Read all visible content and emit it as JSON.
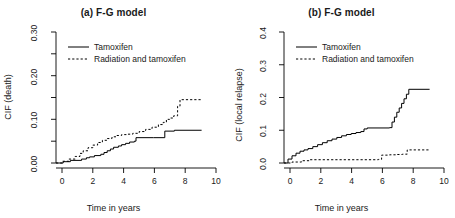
{
  "figure": {
    "panels": [
      {
        "id": "a",
        "title": "(a) F-G model",
        "xlabel": "Time in years",
        "ylabel": "CIF (death)"
      },
      {
        "id": "b",
        "title": "(b) F-G model",
        "xlabel": "Time in years",
        "ylabel": "CIF (local relapse)"
      }
    ],
    "legend": {
      "entries": [
        {
          "label": "Tamoxifen",
          "style": "solid"
        },
        {
          "label": "Radiation and tamoxifen",
          "style": "dashed"
        }
      ]
    },
    "colors": {
      "line": "#000000",
      "axis": "#000000",
      "background": "#ffffff"
    }
  },
  "chart_data": [
    {
      "type": "line",
      "title": "(a) F-G model",
      "xlabel": "Time in years",
      "ylabel": "CIF (death)",
      "xlim": [
        0,
        10
      ],
      "ylim": [
        0,
        0.3
      ],
      "xticks": [
        0,
        2,
        4,
        6,
        8,
        10
      ],
      "xtick_labels": [
        "0",
        "2",
        "4",
        "6",
        "8",
        "10"
      ],
      "yticks": [
        0.0,
        0.05,
        0.1,
        0.15,
        0.2,
        0.25,
        0.3
      ],
      "ytick_labels": [
        "0.00",
        "",
        "0.10",
        "",
        "0.20",
        "",
        "0.30"
      ],
      "grid": false,
      "legend_position": "top-left",
      "step": "post",
      "series": [
        {
          "name": "Tamoxifen",
          "style": "solid",
          "x": [
            0.0,
            0.45,
            0.9,
            1.6,
            1.9,
            2.1,
            2.4,
            2.8,
            3.0,
            3.2,
            3.4,
            3.6,
            3.9,
            4.1,
            4.35,
            4.6,
            4.9,
            5.0,
            6.1,
            6.8,
            7.4,
            9.1
          ],
          "y": [
            0.0,
            0.003,
            0.006,
            0.009,
            0.012,
            0.014,
            0.017,
            0.02,
            0.024,
            0.028,
            0.032,
            0.036,
            0.039,
            0.042,
            0.045,
            0.048,
            0.05,
            0.058,
            0.058,
            0.073,
            0.075,
            0.075
          ]
        },
        {
          "name": "Radiation and tamoxifen",
          "style": "dashed",
          "x": [
            0.0,
            0.4,
            0.8,
            1.2,
            1.5,
            1.7,
            2.0,
            2.3,
            2.6,
            2.9,
            3.2,
            3.5,
            3.8,
            4.1,
            4.4,
            4.8,
            5.2,
            5.6,
            6.0,
            6.4,
            6.7,
            6.9,
            7.1,
            7.35,
            7.6,
            7.75,
            9.1
          ],
          "y": [
            0.0,
            0.004,
            0.009,
            0.015,
            0.022,
            0.028,
            0.035,
            0.041,
            0.047,
            0.052,
            0.056,
            0.06,
            0.063,
            0.065,
            0.066,
            0.068,
            0.072,
            0.077,
            0.082,
            0.088,
            0.093,
            0.1,
            0.103,
            0.108,
            0.13,
            0.145,
            0.145
          ]
        }
      ]
    },
    {
      "type": "line",
      "title": "(b) F-G model",
      "xlabel": "Time in years",
      "ylabel": "CIF (local relapse)",
      "xlim": [
        0,
        10
      ],
      "ylim": [
        0,
        0.4
      ],
      "xticks": [
        0,
        2,
        4,
        6,
        8,
        10
      ],
      "xtick_labels": [
        "0",
        "2",
        "4",
        "6",
        "8",
        "10"
      ],
      "yticks": [
        0.0,
        0.1,
        0.2,
        0.3,
        0.4
      ],
      "ytick_labels": [
        "0.0",
        "0.1",
        "0.2",
        "0.3",
        "0.4"
      ],
      "grid": false,
      "legend_position": "top-left",
      "step": "post",
      "series": [
        {
          "name": "Tamoxifen",
          "style": "solid",
          "x": [
            0.0,
            0.25,
            0.5,
            0.75,
            1.0,
            1.25,
            1.5,
            1.8,
            2.1,
            2.4,
            2.7,
            3.0,
            3.3,
            3.6,
            3.9,
            4.2,
            4.5,
            4.8,
            5.0,
            5.2,
            6.0,
            6.6,
            6.75,
            6.9,
            7.05,
            7.2,
            7.35,
            7.5,
            7.65,
            7.8,
            9.1
          ],
          "y": [
            0.0,
            0.012,
            0.022,
            0.03,
            0.036,
            0.04,
            0.044,
            0.05,
            0.056,
            0.062,
            0.068,
            0.073,
            0.078,
            0.083,
            0.087,
            0.09,
            0.093,
            0.096,
            0.104,
            0.107,
            0.107,
            0.108,
            0.125,
            0.14,
            0.155,
            0.168,
            0.182,
            0.196,
            0.21,
            0.225,
            0.225
          ]
        },
        {
          "name": "Radiation and tamoxifen",
          "style": "dashed",
          "x": [
            0.0,
            0.5,
            1.1,
            1.6,
            3.0,
            5.0,
            5.9,
            6.1,
            6.6,
            7.0,
            7.4,
            7.7,
            9.1
          ],
          "y": [
            0.0,
            0.003,
            0.007,
            0.01,
            0.01,
            0.01,
            0.011,
            0.024,
            0.025,
            0.026,
            0.027,
            0.04,
            0.04
          ]
        }
      ]
    }
  ]
}
